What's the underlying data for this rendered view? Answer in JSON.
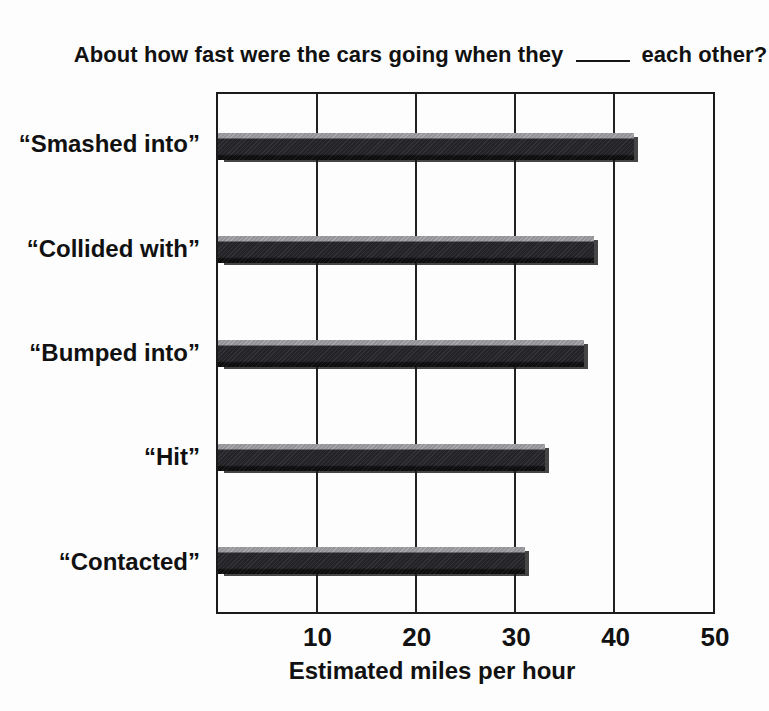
{
  "figure": {
    "title_prefix": "About how fast were the cars going when they",
    "title_suffix": "each other?"
  },
  "chart_data": {
    "type": "bar",
    "orientation": "horizontal",
    "categories": [
      "“Smashed into”",
      "“Collided with”",
      "“Bumped into”",
      "“Hit”",
      "“Contacted”"
    ],
    "values": [
      42,
      38,
      37,
      33,
      31
    ],
    "xlabel": "Estimated miles per hour",
    "xlim": [
      0,
      50
    ],
    "xticks": [
      10,
      20,
      30,
      40,
      50
    ],
    "grid": "vertical-gridlines-at-ticks",
    "legend": "none",
    "colors": {
      "bar_body": "#28282c",
      "bar_highlight": "#a5a5a9",
      "bar_bottom": "#0e0e0f",
      "axis": "#1b1b1b",
      "text": "#111111",
      "background": "#fdfdfd"
    }
  }
}
